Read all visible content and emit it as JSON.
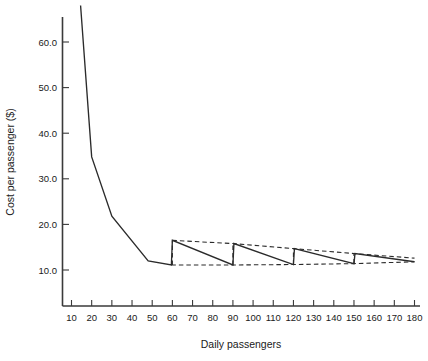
{
  "chart_data": {
    "type": "line",
    "title": "",
    "xlabel": "Daily passengers",
    "ylabel": "Cost per passenger ($)",
    "xlim": [
      0,
      185
    ],
    "ylim": [
      5,
      68
    ],
    "grid": false,
    "legend": "none",
    "xticks": [
      10,
      20,
      30,
      40,
      50,
      60,
      70,
      80,
      90,
      100,
      110,
      120,
      130,
      140,
      150,
      160,
      170,
      180
    ],
    "xtick_labels": [
      "10",
      "20",
      "30",
      "40",
      "50",
      "60",
      "70",
      "80",
      "90",
      "100",
      "110",
      "120",
      "130",
      "140",
      "150",
      "160",
      "170",
      "180"
    ],
    "yticks": [
      10,
      20,
      30,
      40,
      50,
      60
    ],
    "ytick_labels": [
      "10.0",
      "20.0",
      "30.0",
      "40.0",
      "50.0",
      "60.0"
    ],
    "series": [
      {
        "name": "Cost per passenger",
        "style": "solid",
        "color": "#2b2b2b",
        "points": [
          [
            14.5,
            68.0
          ],
          [
            20.0,
            34.8
          ],
          [
            30.0,
            21.8
          ],
          [
            48.0,
            12.0
          ],
          [
            59.5,
            11.1
          ],
          [
            60.0,
            16.5
          ],
          [
            90.0,
            11.1
          ],
          [
            90.5,
            15.8
          ],
          [
            120.0,
            11.2
          ],
          [
            120.5,
            14.7
          ],
          [
            150.0,
            11.4
          ],
          [
            150.5,
            13.6
          ],
          [
            180.0,
            11.8
          ]
        ]
      },
      {
        "name": "Upper envelope",
        "style": "dashed",
        "color": "#2b2b2b",
        "points": [
          [
            60.0,
            16.5
          ],
          [
            90.0,
            15.8
          ],
          [
            120.0,
            14.7
          ],
          [
            150.0,
            13.6
          ],
          [
            180.0,
            12.6
          ]
        ]
      },
      {
        "name": "Lower envelope",
        "style": "dashed",
        "color": "#2b2b2b",
        "points": [
          [
            59.5,
            11.1
          ],
          [
            90.0,
            11.1
          ],
          [
            120.0,
            11.2
          ],
          [
            150.0,
            11.4
          ],
          [
            180.0,
            11.8
          ]
        ]
      },
      {
        "name": "Step risers",
        "style": "dashed",
        "color": "#2b2b2b",
        "risers": [
          {
            "x": 60.0,
            "y0": 11.1,
            "y1": 16.5
          },
          {
            "x": 90.0,
            "y0": 11.1,
            "y1": 15.8
          },
          {
            "x": 120.0,
            "y0": 11.2,
            "y1": 14.7
          },
          {
            "x": 150.0,
            "y0": 11.4,
            "y1": 13.6
          }
        ]
      }
    ]
  },
  "axis": {
    "x_title": "Daily passengers",
    "y_title": "Cost per passenger ($)"
  }
}
